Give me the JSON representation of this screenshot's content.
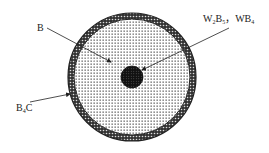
{
  "diagram": {
    "title": "",
    "labels": {
      "boron": {
        "base": "B",
        "sub": ""
      },
      "tungsten_boride": {
        "part1_base": "W",
        "part1_sub": "2",
        "part1_base2": "B",
        "part1_sub2": "5",
        "separator": "，",
        "part2_base": "WB",
        "part2_sub": "4"
      },
      "boron_carbide": {
        "base": "B",
        "sub": "4",
        "tail": "C"
      }
    },
    "regions": [
      {
        "name": "outer-coating",
        "material": "B4C"
      },
      {
        "name": "boron-fiber-body",
        "material": "B"
      },
      {
        "name": "core",
        "material": "W2B5, WB4"
      }
    ],
    "colors": {
      "ink": "#222222",
      "core": "#111111",
      "background": "#ffffff"
    }
  }
}
